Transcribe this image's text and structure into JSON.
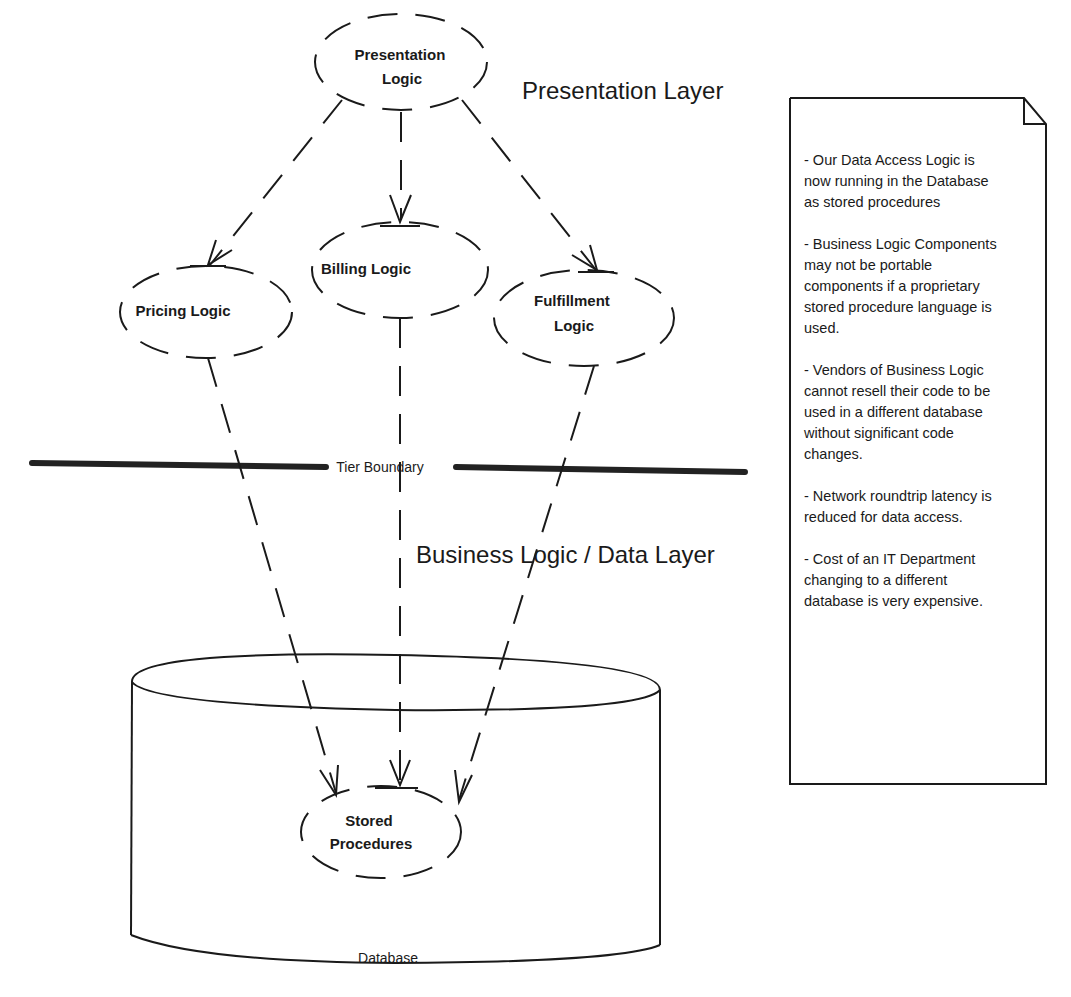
{
  "diagram": {
    "layers": {
      "presentation": "Presentation Layer",
      "business_data": "Business Logic / Data Layer"
    },
    "tier_boundary": "Tier Boundary",
    "nodes": {
      "presentation_logic": [
        "Presentation",
        "Logic"
      ],
      "pricing_logic": "Pricing Logic",
      "billing_logic": "Billing Logic",
      "fulfillment_logic": [
        "Fulfillment",
        "Logic"
      ],
      "stored_procedures": [
        "Stored",
        "Procedures"
      ]
    },
    "database_label": "Database",
    "edges": [
      {
        "from": "Presentation Logic",
        "to": "Pricing Logic",
        "style": "dashed-arrow"
      },
      {
        "from": "Presentation Logic",
        "to": "Billing Logic",
        "style": "dashed-arrow"
      },
      {
        "from": "Presentation Logic",
        "to": "Fulfillment Logic",
        "style": "dashed-arrow"
      },
      {
        "from": "Pricing Logic",
        "to": "Stored Procedures",
        "style": "dashed-arrow"
      },
      {
        "from": "Billing Logic",
        "to": "Stored Procedures",
        "style": "dashed-arrow"
      },
      {
        "from": "Fulfillment Logic",
        "to": "Stored Procedures",
        "style": "dashed-arrow"
      }
    ]
  },
  "note": {
    "items": [
      "- Our Data Access Logic is now running in the Database as stored procedures",
      "- Business Logic Components may not be portable components if a proprietary stored procedure language is used.",
      "- Vendors of Business Logic cannot resell their code to be used in a different database without significant code changes.",
      "- Network roundtrip latency is reduced for data access.",
      "- Cost of an IT Department changing to a different database is very expensive."
    ]
  }
}
